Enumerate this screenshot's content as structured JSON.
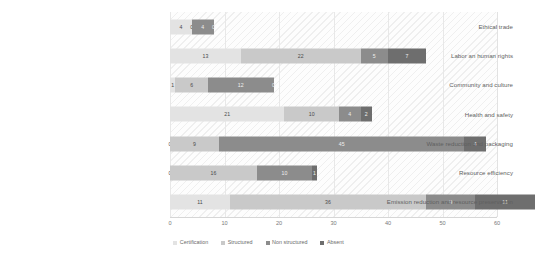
{
  "chart_data": {
    "type": "bar",
    "subtype": "stacked-horizontal-bar",
    "title": "",
    "xlabel": "",
    "ylabel": "",
    "xlim": [
      0,
      60
    ],
    "xticks": [
      "0",
      "10",
      "20",
      "30",
      "40",
      "50",
      "60"
    ],
    "grid": true,
    "legend_position": "bottom",
    "categories": [
      "Ethical trade",
      "Labor an human rights",
      "Community and culture",
      "Health and safety",
      "Waste reduction and packaging",
      "Resource  efficiency",
      "Emission reduction and resource preservation"
    ],
    "series": [
      {
        "name": "Certification",
        "color": "#e3e3e3",
        "values": [
          4,
          13,
          1,
          21,
          0,
          0,
          11
        ]
      },
      {
        "name": "Structured",
        "color": "#c9c9c9",
        "values": [
          0,
          22,
          6,
          10,
          9,
          16,
          36
        ]
      },
      {
        "name": "Non structured",
        "color": "#8c8c8c",
        "values": [
          4,
          5,
          12,
          4,
          45,
          10,
          9
        ]
      },
      {
        "name": "Absent",
        "color": "#6e6e6e",
        "values": [
          0,
          7,
          0,
          2,
          4,
          1,
          11
        ]
      }
    ],
    "totals": [
      8,
      47,
      19,
      37,
      58,
      27,
      67
    ]
  },
  "legend": {
    "items": [
      {
        "label": "Certification"
      },
      {
        "label": "Structured"
      },
      {
        "label": "Non structured"
      },
      {
        "label": "Absent"
      }
    ]
  }
}
